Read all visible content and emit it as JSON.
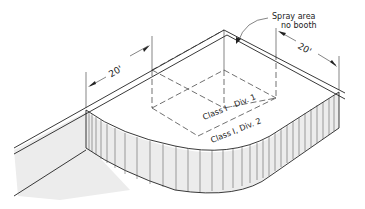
{
  "diagram": {
    "labels": {
      "spray_area": "Spray area",
      "no_booth": "no booth",
      "class1_div1": "Class I - Div. 1",
      "class1_div2": "Class I, Div. 2",
      "dim_left": "20'",
      "dim_right": "20'"
    },
    "colors": {
      "line": "#222222",
      "wall_fill": "#ececec",
      "background": "#ffffff"
    }
  }
}
